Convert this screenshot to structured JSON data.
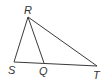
{
  "diagram": {
    "type": "geometry-triangle",
    "points": [
      {
        "id": "R",
        "label": "R"
      },
      {
        "id": "S",
        "label": "S"
      },
      {
        "id": "Q",
        "label": "Q"
      },
      {
        "id": "T",
        "label": "T"
      }
    ],
    "segments": [
      {
        "from": "R",
        "to": "S"
      },
      {
        "from": "R",
        "to": "Q"
      },
      {
        "from": "R",
        "to": "T"
      },
      {
        "from": "S",
        "to": "T"
      }
    ],
    "colors": {
      "stroke": "#3a3a3a",
      "label": "#333333",
      "background": "#ffffff"
    }
  }
}
